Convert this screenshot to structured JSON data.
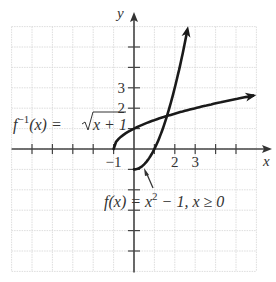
{
  "chart_data": {
    "type": "line",
    "title": "",
    "xlabel": "x",
    "ylabel": "y",
    "xlim": [
      -6,
      6
    ],
    "ylim": [
      -6,
      6
    ],
    "grid": true,
    "x_tick_labels": [
      {
        "value": -1,
        "label": "−1"
      },
      {
        "value": 2,
        "label": "2"
      },
      {
        "value": 3,
        "label": "3"
      }
    ],
    "y_tick_labels": [
      {
        "value": 2,
        "label": "2"
      },
      {
        "value": 3,
        "label": "3"
      }
    ],
    "series": [
      {
        "name": "f(x) = x² − 1, x ≥ 0",
        "function": "x^2 - 1",
        "domain": [
          0,
          2.65
        ],
        "arrow_end": true
      },
      {
        "name": "f⁻¹(x) = √(x + 1)",
        "function": "sqrt(x + 1)",
        "domain": [
          -1,
          6
        ],
        "arrow_end": true
      }
    ],
    "annotations": [
      {
        "text_parts": [
          "f",
          "⁻¹",
          "(x) = ",
          "x + 1"
        ],
        "target": "f⁻¹(x) = √(x + 1)"
      },
      {
        "text_parts": [
          "f(x) = x",
          "2",
          " − 1, x ≥ 0"
        ],
        "target": "f(x) = x² − 1, x ≥ 0"
      }
    ]
  },
  "labels": {
    "x_axis": "x",
    "y_axis": "y",
    "inverse_f": "f",
    "inverse_sup": "−1",
    "inverse_arg": "(x) = ",
    "inverse_radicand": "x + 1",
    "f_prefix": "f(x) = x",
    "f_sup": "2",
    "f_suffix": " − 1, x ≥ 0"
  }
}
